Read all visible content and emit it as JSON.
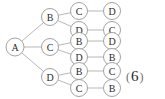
{
  "diagram": {
    "type": "permutation-tree",
    "title": "",
    "root": {
      "id": "root",
      "label": "A",
      "cx": 15,
      "cy": 47,
      "r": 9
    },
    "level2": [
      {
        "id": "l2-b",
        "label": "B",
        "cx": 50,
        "cy": 17,
        "r": 8.5
      },
      {
        "id": "l2-c",
        "label": "C",
        "cx": 50,
        "cy": 47,
        "r": 8.5
      },
      {
        "id": "l2-d",
        "label": "D",
        "cx": 50,
        "cy": 77,
        "r": 8.5
      }
    ],
    "level3": [
      {
        "id": "l3-1",
        "label": "C",
        "cx": 79,
        "cy": 11,
        "r": 8.5,
        "parent": "l2-b"
      },
      {
        "id": "l3-2",
        "label": "D",
        "cx": 79,
        "cy": 30,
        "r": 8.5,
        "parent": "l2-b"
      },
      {
        "id": "l3-3",
        "label": "B",
        "cx": 79,
        "cy": 41,
        "r": 8.5,
        "parent": "l2-c"
      },
      {
        "id": "l3-4",
        "label": "D",
        "cx": 79,
        "cy": 57,
        "r": 8.5,
        "parent": "l2-c"
      },
      {
        "id": "l3-5",
        "label": "B",
        "cx": 79,
        "cy": 71,
        "r": 8.5,
        "parent": "l2-d"
      },
      {
        "id": "l3-6",
        "label": "C",
        "cx": 79,
        "cy": 88,
        "r": 8.5,
        "parent": "l2-d"
      }
    ],
    "level4": [
      {
        "id": "l4-1",
        "label": "D",
        "cx": 112,
        "cy": 11,
        "r": 8.5,
        "parent": "l3-1"
      },
      {
        "id": "l4-2",
        "label": "C",
        "cx": 112,
        "cy": 30,
        "r": 8.5,
        "parent": "l3-2"
      },
      {
        "id": "l4-3",
        "label": "D",
        "cx": 112,
        "cy": 41,
        "r": 8.5,
        "parent": "l3-3"
      },
      {
        "id": "l4-4",
        "label": "B",
        "cx": 112,
        "cy": 57,
        "r": 8.5,
        "parent": "l3-4"
      },
      {
        "id": "l4-5",
        "label": "C",
        "cx": 112,
        "cy": 71,
        "r": 8.5,
        "parent": "l3-5"
      },
      {
        "id": "l4-6",
        "label": "B",
        "cx": 112,
        "cy": 88,
        "r": 8.5,
        "parent": "l3-6"
      }
    ],
    "paths": [
      [
        "A",
        "B",
        "C",
        "D"
      ],
      [
        "A",
        "B",
        "D",
        "C"
      ],
      [
        "A",
        "C",
        "B",
        "D"
      ],
      [
        "A",
        "C",
        "D",
        "B"
      ],
      [
        "A",
        "D",
        "B",
        "C"
      ],
      [
        "A",
        "D",
        "C",
        "B"
      ]
    ],
    "edge_color": "#9a9a9a",
    "node_stroke": "#8c8c8c",
    "node_fill": "#ffffff",
    "label_color": "#2b2b2b"
  },
  "annotation": {
    "open_paren": "(",
    "number": "6",
    "close_paren": ")",
    "clipped_glyph": " "
  }
}
